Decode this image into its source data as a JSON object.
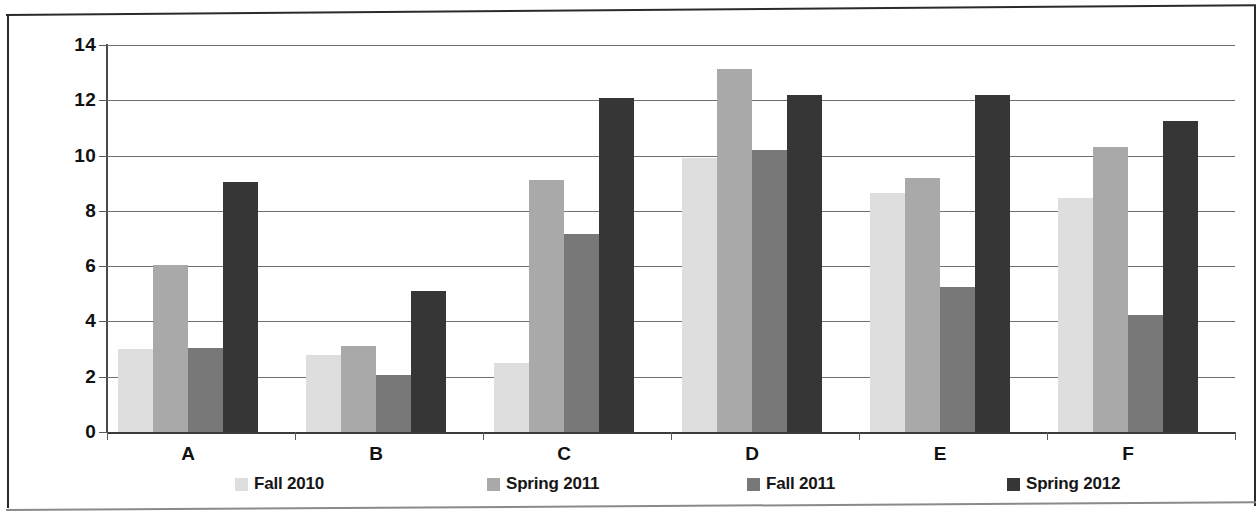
{
  "chart_data": {
    "type": "bar",
    "title": "",
    "subtitle": "",
    "xlabel": "",
    "ylabel": "",
    "categories": [
      "A",
      "B",
      "C",
      "D",
      "E",
      "F"
    ],
    "ylim": [
      0,
      14
    ],
    "yticks": [
      0,
      2,
      4,
      6,
      8,
      10,
      12,
      14
    ],
    "ytick_labels": [
      "0",
      "2",
      "4",
      "6",
      "8",
      "10",
      "12",
      "14"
    ],
    "grid": true,
    "legend_position": "bottom",
    "series": [
      {
        "name": "Fall 2010",
        "color": "#dedede",
        "values": [
          3.0,
          2.8,
          2.5,
          9.9,
          8.65,
          8.45
        ]
      },
      {
        "name": "Spring 2011",
        "color": "#a9a9a9",
        "values": [
          6.05,
          3.1,
          9.1,
          13.15,
          9.2,
          10.3
        ]
      },
      {
        "name": "Fall 2011",
        "color": "#787878",
        "values": [
          3.05,
          2.05,
          7.15,
          10.2,
          5.25,
          4.25
        ]
      },
      {
        "name": "Spring 2012",
        "color": "#363636",
        "values": [
          9.05,
          5.1,
          12.1,
          12.2,
          12.2,
          11.25
        ]
      }
    ]
  },
  "legend": {
    "items": [
      {
        "label": "Fall 2010",
        "swatch": "legend-swatch-fall-2010",
        "color": "#dedede"
      },
      {
        "label": "Spring 2011",
        "swatch": "legend-swatch-spring-2011",
        "color": "#a9a9a9"
      },
      {
        "label": "Fall 2011",
        "swatch": "legend-swatch-fall-2011",
        "color": "#787878"
      },
      {
        "label": "Spring 2012",
        "swatch": "legend-swatch-spring-2012",
        "color": "#363636"
      }
    ]
  }
}
